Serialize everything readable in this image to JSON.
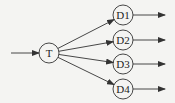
{
  "diagram": {
    "type": "fan-out graph",
    "source": {
      "id": "T",
      "label": "T",
      "cx": 49,
      "cy": 53,
      "r": 10
    },
    "targets": [
      {
        "id": "D1",
        "label": "D1",
        "cx": 123,
        "cy": 15,
        "r": 10
      },
      {
        "id": "D2",
        "label": "D2",
        "cx": 123,
        "cy": 40,
        "r": 10
      },
      {
        "id": "D3",
        "label": "D3",
        "cx": 123,
        "cy": 64,
        "r": 10
      },
      {
        "id": "D4",
        "label": "D4",
        "cx": 123,
        "cy": 89,
        "r": 10
      }
    ],
    "input_arrow": {
      "x1": 11,
      "y1": 53,
      "x2": 39,
      "y2": 53
    },
    "output_arrows": [
      {
        "x1": 133,
        "y1": 15,
        "x2": 165,
        "y2": 15
      },
      {
        "x1": 133,
        "y1": 40,
        "x2": 165,
        "y2": 40
      },
      {
        "x1": 133,
        "y1": 64,
        "x2": 165,
        "y2": 64
      },
      {
        "x1": 133,
        "y1": 89,
        "x2": 165,
        "y2": 89
      }
    ],
    "colors": {
      "stroke": "#333333",
      "background": "#f4f4f2"
    }
  }
}
